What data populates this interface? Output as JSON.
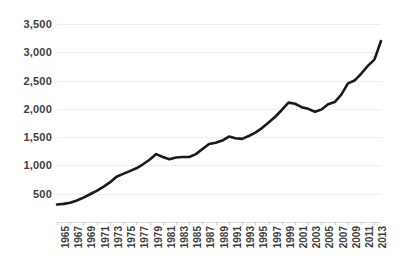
{
  "chart_data": {
    "type": "line",
    "title": "",
    "subtitle": "",
    "xlabel": "",
    "ylabel": "",
    "xlim": [
      1965,
      2014
    ],
    "ylim": [
      0,
      3500
    ],
    "grid": true,
    "legend": null,
    "legend_position": "none",
    "line_color": "#1a1a1a",
    "gridline_color": "#eceff1",
    "background_color": "#ffffff",
    "ytick_labels": [
      "3,500",
      "3,000",
      "2,500",
      "2,000",
      "1,500",
      "1,000",
      "500"
    ],
    "ytick_values": [
      3500,
      3000,
      2500,
      2000,
      1500,
      1000,
      500
    ],
    "xtick_labels": [
      "1965",
      "1967",
      "1969",
      "1971",
      "1973",
      "1975",
      "1977",
      "1979",
      "1981",
      "1983",
      "1985",
      "1987",
      "1989",
      "1991",
      "1993",
      "1995",
      "1997",
      "1999",
      "2001",
      "2003",
      "2005",
      "2007",
      "2009",
      "2011",
      "2013"
    ],
    "xtick_values": [
      1965,
      1967,
      1969,
      1971,
      1973,
      1975,
      1977,
      1979,
      1981,
      1983,
      1985,
      1987,
      1989,
      1991,
      1993,
      1995,
      1997,
      1999,
      2001,
      2003,
      2005,
      2007,
      2009,
      2011,
      2013
    ],
    "x": [
      1965,
      1966,
      1967,
      1968,
      1969,
      1970,
      1971,
      1972,
      1973,
      1974,
      1975,
      1976,
      1977,
      1978,
      1979,
      1980,
      1981,
      1982,
      1983,
      1984,
      1985,
      1986,
      1987,
      1988,
      1989,
      1990,
      1991,
      1992,
      1993,
      1994,
      1995,
      1996,
      1997,
      1998,
      1999,
      2000,
      2001,
      2002,
      2003,
      2004,
      2005,
      2006,
      2007,
      2008,
      2009,
      2010,
      2011,
      2012,
      2013,
      2014
    ],
    "values": [
      310,
      320,
      340,
      380,
      430,
      490,
      550,
      620,
      700,
      800,
      850,
      900,
      950,
      1020,
      1100,
      1200,
      1150,
      1110,
      1140,
      1150,
      1150,
      1200,
      1290,
      1380,
      1400,
      1440,
      1510,
      1480,
      1470,
      1520,
      1580,
      1660,
      1760,
      1860,
      1980,
      2110,
      2090,
      2030,
      2000,
      1950,
      1990,
      2080,
      2120,
      2250,
      2450,
      2500,
      2620,
      2760,
      2870,
      3200
    ],
    "series": [
      {
        "name": "series-1",
        "values": [
          310,
          320,
          340,
          380,
          430,
          490,
          550,
          620,
          700,
          800,
          850,
          900,
          950,
          1020,
          1100,
          1200,
          1150,
          1110,
          1140,
          1150,
          1150,
          1200,
          1290,
          1380,
          1400,
          1440,
          1510,
          1480,
          1470,
          1520,
          1580,
          1660,
          1760,
          1860,
          1980,
          2110,
          2090,
          2030,
          2000,
          1950,
          1990,
          2080,
          2120,
          2250,
          2450,
          2500,
          2620,
          2760,
          2870,
          3200
        ]
      }
    ]
  }
}
